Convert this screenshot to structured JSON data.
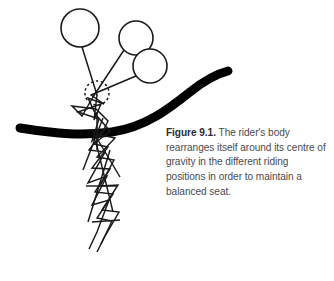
{
  "figure": {
    "caption_label": "Figure 9.1.",
    "caption_text": " The rider's body rearranges itself around its centre of gravity in the different riding positions in order to maintain a balanced seat.",
    "caption_full": "Figure 9.1. The rider's body rearranges itself around its centre of gravity in the different riding positions in order to maintain a balanced seat.",
    "caption_lines": [
      "Figure 9.1. The rider's body",
      "rearranges itself around its",
      "centre of gravity in the different",
      "riding positions in order to",
      "maintain a balanced seat."
    ],
    "background_color": "#ffffff",
    "caption_label_color": "#2b2b30",
    "caption_body_color": "#4a4a4f",
    "line_color": "#1a1a1a",
    "horse_back_color": "#000000",
    "illustration": {
      "description": "Stick-figure rider shown in three superimposed riding positions above a thick curved line representing the horse's back, with a dotted circle marking the centre of gravity.",
      "horse_back": {
        "name": "horse-back-curve",
        "path": "M 20 128 C 58 134, 82 136, 112 132 C 146 127, 170 108, 190 92 C 205 80, 216 74, 228 71",
        "stroke_width": 9
      },
      "centre_of_gravity": {
        "name": "centre-of-gravity-marker",
        "cx": 97,
        "cy": 93,
        "r": 12,
        "dash": "2.4 2.6",
        "stroke_width": 1.5
      },
      "heads": [
        {
          "name": "head-position-1",
          "cx": 80,
          "cy": 28,
          "r": 19
        },
        {
          "name": "head-position-2",
          "cx": 136,
          "cy": 38,
          "r": 17
        },
        {
          "name": "head-position-3",
          "cx": 150,
          "cy": 66,
          "r": 17
        }
      ],
      "torsos": [
        {
          "name": "torso-position-1",
          "x1": 82,
          "y1": 47,
          "x2": 97,
          "y2": 95
        },
        {
          "name": "torso-position-2",
          "x1": 124,
          "y1": 50,
          "x2": 93,
          "y2": 97
        },
        {
          "name": "torso-position-3",
          "x1": 136,
          "y1": 76,
          "x2": 91,
          "y2": 95
        }
      ],
      "bodies": [
        {
          "name": "rider-position-1",
          "path": "M 97 95 L 94 120 L 101 104 L 78 112 L 99 119 L 92 141 L 106 128 L 89 150 L 105 152 L 88 183 L 107 176 L 92 205 L 109 200 L 97 232 L 89 249"
        },
        {
          "name": "rider-position-2",
          "path": "M 93 97 L 82 116 L 72 106 L 96 109 L 108 121 L 101 135 L 115 138 L 97 157 L 114 160 L 100 186 L 118 185 L 102 210 L 119 212 L 104 238 L 97 252"
        },
        {
          "name": "rider-position-3",
          "path": "M 91 95 L 104 104 L 88 98 L 96 115 L 110 131 L 94 144 L 108 147 L 92 168 L 110 169 L 95 192 L 113 194 L 97 218 L 112 221 L 101 244"
        }
      ],
      "legs_extra": [
        {
          "name": "leg-line-a",
          "x1": 92,
          "y1": 130,
          "x2": 120,
          "y2": 177
        },
        {
          "name": "leg-line-b",
          "x1": 103,
          "y1": 118,
          "x2": 83,
          "y2": 170
        },
        {
          "name": "leg-line-c",
          "x1": 96,
          "y1": 142,
          "x2": 113,
          "y2": 212
        },
        {
          "name": "leg-line-d",
          "x1": 110,
          "y1": 150,
          "x2": 88,
          "y2": 222
        },
        {
          "name": "leg-line-e",
          "x1": 86,
          "y1": 186,
          "x2": 116,
          "y2": 186
        },
        {
          "name": "leg-line-f",
          "x1": 92,
          "y1": 222,
          "x2": 120,
          "y2": 220
        },
        {
          "name": "leg-line-g",
          "x1": 97,
          "y1": 112,
          "x2": 97,
          "y2": 150
        }
      ]
    }
  }
}
